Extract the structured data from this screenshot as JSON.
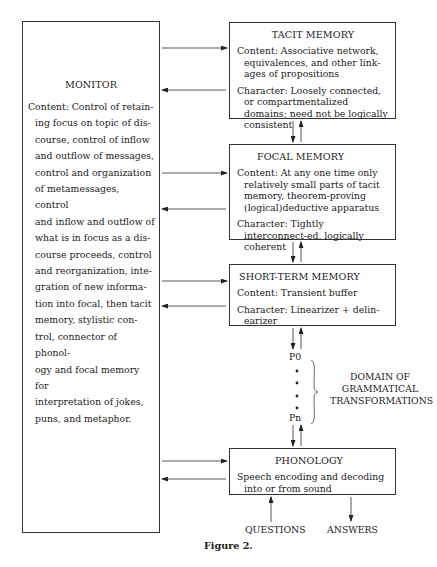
{
  "monitor": {
    "title": "MONITOR",
    "content_lines": [
      "Content: Control of retain-",
      "ing focus on topic of dis-",
      "course, control of inflow",
      "and outflow of messages,",
      "control and organization",
      "of metamessages, control",
      "and inflow and outflow of",
      "what is in focus as a dis-",
      "course proceeds, control",
      "and reorganization, inte-",
      "gration of new informa-",
      "tion into focal, then tacit",
      "memory, stylistic con-",
      "trol, connector of phonol-",
      "ogy and focal memory for",
      "interpretation of jokes,",
      "puns, and metaphor."
    ]
  },
  "tacit_memory": {
    "title": "TACIT MEMORY",
    "content": "Content: Associative network, equivalences, and other link-ages of propositions",
    "character": "Character: Loosely connected, or compartmentalized domains; need not be logically consistent"
  },
  "focal_memory": {
    "title": "FOCAL MEMORY",
    "content": "Content: At any one time only relatively small parts of tacit memory, theorem-proving (logical)deductive apparatus",
    "character": "Character: Tightly interconnect-ed, logically coherent"
  },
  "short_term_memory": {
    "title": "SHORT-TERM MEMORY",
    "content": "Content: Transient buffer",
    "character": "Character: Linearizer + delin-earizer"
  },
  "transformations": {
    "start_label": "P0",
    "end_label": "Pn",
    "domain_label_line1": "DOMAIN OF",
    "domain_label_line2": "GRAMMATICAL",
    "domain_label_line3": "TRANSFORMATIONS"
  },
  "phonology": {
    "title": "PHONOLOGY",
    "content": "Speech encoding and decoding into or from sound"
  },
  "io": {
    "questions_label": "QUESTIONS",
    "answers_label": "ANSWERS"
  },
  "caption": "Figure 2.",
  "colors": {
    "line": "#333333",
    "text": "#1a1a1a",
    "background": "#ffffff"
  }
}
